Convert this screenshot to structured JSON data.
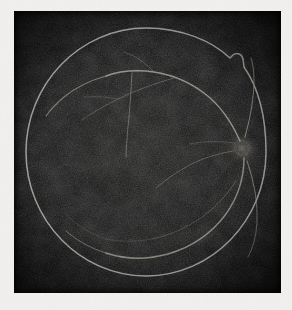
{
  "document": {
    "kind": "retinal-fundus-photograph",
    "modality": "fluorescein-angiogram",
    "color_mode": "monochrome",
    "eye_laterality": "left-eye",
    "caption": ""
  },
  "canvas": {
    "width": 292,
    "height": 310,
    "paper_color": "#f3f1ef",
    "paper_shadow_color": "#d8d5d2"
  },
  "plate": {
    "x": 14,
    "y": 11,
    "width": 267,
    "height": 282,
    "background_color": "#070707",
    "interior_color": "#121212",
    "noise_opacity": 0.85
  },
  "retina": {
    "rim": {
      "center_x": 132,
      "center_y": 141,
      "radius_x": 120,
      "radius_y": 124,
      "stroke_color": "#9a9a92",
      "stroke_width": 1.6,
      "notch": {
        "present": true,
        "position": "superior-temporal",
        "center_x": 223,
        "center_y": 51,
        "size": 9,
        "label": "rim-notch"
      }
    },
    "optic_disc": {
      "center_x": 228,
      "center_y": 137,
      "radius": 13,
      "glow_color": "#6e6a60",
      "label": "optic-disc"
    },
    "macula": {
      "center_x": 130,
      "center_y": 150,
      "radius": 26,
      "label": "macula"
    },
    "vessel_color": "#8d8a80",
    "vessel_color_faint": "#56544d"
  },
  "chart_data": {
    "type": "scatter",
    "xlabel": "",
    "ylabel": "",
    "categories": [
      "optic-disc",
      "superior-temporal-arcade",
      "superior-nasal-arcade",
      "inferior-temporal-arcade",
      "inferior-nasal-arcade",
      "macular-branch",
      "rim-boundary",
      "rim-notch"
    ],
    "values": [
      1,
      1,
      1,
      1,
      1,
      1,
      1,
      1
    ]
  }
}
